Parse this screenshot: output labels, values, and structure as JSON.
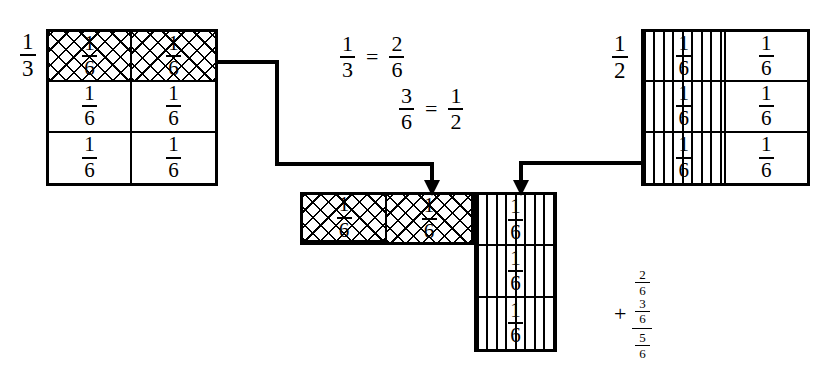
{
  "diagram": {
    "ink_color": "#000000",
    "background_color": "#ffffff"
  },
  "left_model": {
    "side_label": {
      "numerator": "1",
      "denominator": "3"
    },
    "columns": 2,
    "rows": 3,
    "cells": [
      {
        "numerator": "1",
        "denominator": "6",
        "fill": "cross-hatch"
      },
      {
        "numerator": "1",
        "denominator": "6",
        "fill": "cross-hatch"
      },
      {
        "numerator": "1",
        "denominator": "6",
        "fill": "none"
      },
      {
        "numerator": "1",
        "denominator": "6",
        "fill": "none"
      },
      {
        "numerator": "1",
        "denominator": "6",
        "fill": "none"
      },
      {
        "numerator": "1",
        "denominator": "6",
        "fill": "none"
      }
    ]
  },
  "right_model": {
    "side_label": {
      "numerator": "1",
      "denominator": "2"
    },
    "columns": 2,
    "rows": 3,
    "cells": [
      {
        "numerator": "1",
        "denominator": "6",
        "fill": "vertical-stripes"
      },
      {
        "numerator": "1",
        "denominator": "6",
        "fill": "none"
      },
      {
        "numerator": "1",
        "denominator": "6",
        "fill": "vertical-stripes"
      },
      {
        "numerator": "1",
        "denominator": "6",
        "fill": "none"
      },
      {
        "numerator": "1",
        "denominator": "6",
        "fill": "vertical-stripes"
      },
      {
        "numerator": "1",
        "denominator": "6",
        "fill": "none"
      }
    ]
  },
  "result_model": {
    "top_row": [
      {
        "numerator": "1",
        "denominator": "6",
        "fill": "cross-hatch"
      },
      {
        "numerator": "1",
        "denominator": "6",
        "fill": "cross-hatch"
      },
      {
        "numerator": "1",
        "denominator": "6",
        "fill": "vertical-stripes"
      }
    ],
    "column": [
      {
        "numerator": "1",
        "denominator": "6",
        "fill": "vertical-stripes"
      },
      {
        "numerator": "1",
        "denominator": "6",
        "fill": "vertical-stripes"
      }
    ]
  },
  "equations": [
    {
      "left": {
        "numerator": "1",
        "denominator": "3"
      },
      "op": "=",
      "right": {
        "numerator": "2",
        "denominator": "6"
      }
    },
    {
      "left": {
        "numerator": "3",
        "denominator": "6"
      },
      "op": "=",
      "right": {
        "numerator": "1",
        "denominator": "2"
      }
    }
  ],
  "sum": {
    "plus": "+",
    "addend_1": {
      "numerator": "2",
      "denominator": "6"
    },
    "addend_2": {
      "numerator": "3",
      "denominator": "6"
    },
    "total": {
      "numerator": "5",
      "denominator": "6"
    }
  }
}
